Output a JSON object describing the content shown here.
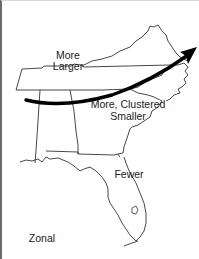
{
  "map": {
    "region": "Southeastern United States",
    "states_outlined": [
      "Tennessee",
      "Virginia",
      "North Carolina",
      "South Carolina",
      "Georgia",
      "Alabama",
      "Florida"
    ],
    "arrow": {
      "direction": "southwest-to-northeast",
      "color": "#000000"
    },
    "labels": {
      "north_line1": "More",
      "north_line2": "Larger",
      "middle_line1": "More, Clustered",
      "middle_line2": "Smaller",
      "south": "Fewer",
      "corner": "Zonal"
    },
    "colors": {
      "background": "#ffffff",
      "outline": "#333333",
      "arrow": "#000000",
      "text": "#1a1a1a"
    }
  }
}
